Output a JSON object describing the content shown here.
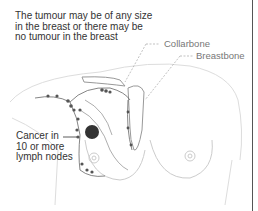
{
  "diagram": {
    "heading": "The tumour may be of any size\nin the breast or there may be\nno tumour in the breast",
    "labels": {
      "collarbone": "Collarbone",
      "breastbone": "Breastbone"
    },
    "callout": "Cancer in\n10 or more\nlymph nodes",
    "colors": {
      "text": "#333333",
      "label": "#777777",
      "outline": "#bbbbbb",
      "lymph": "#555555",
      "tumour": "#333333"
    }
  }
}
